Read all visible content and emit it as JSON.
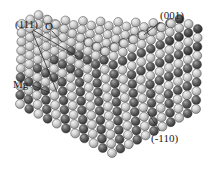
{
  "figure": {
    "kind": "crystal-ball-model",
    "background_color": "#ffffff",
    "width": 209,
    "height": 179
  },
  "labels": {
    "plane_111": "(111)",
    "ion_oxygen": "O",
    "ion_magnesium": "Mg",
    "plane_001": "(001)",
    "plane_m110": "(-110)"
  },
  "legend_mapping": {
    "oxygen_sphere_color": "#4a4a4a",
    "magnesium_sphere_color": "#c9c9c9",
    "outline_color": "#3a3a3a",
    "label_color": "#1a1a1a"
  },
  "leader_lines": [
    {
      "name": "111-upper",
      "from": [
        33,
        30
      ],
      "to": [
        78,
        57
      ]
    },
    {
      "name": "111-lower",
      "from": [
        32,
        31
      ],
      "to": [
        57,
        92
      ]
    },
    {
      "name": "O-pointer",
      "from": [
        52,
        31
      ],
      "to": [
        62,
        42
      ]
    },
    {
      "name": "Mg-pointer",
      "from": [
        32,
        85
      ],
      "to": [
        50,
        93
      ]
    },
    {
      "name": "001-pointer",
      "from": [
        160,
        22
      ],
      "to": [
        144,
        35
      ]
    },
    {
      "name": "m110-pointer",
      "from": [
        160,
        131
      ],
      "to": [
        146,
        110
      ]
    }
  ],
  "structure": {
    "lattice": "rock-salt",
    "visible_faces": [
      "(001) top",
      "(111) stepped left-front",
      "(-110) right"
    ],
    "sphere_diameter_px": 9,
    "top_face_rows": 11,
    "top_face_cols": 13,
    "front_face_rows": 10,
    "right_face_rows": 10
  }
}
